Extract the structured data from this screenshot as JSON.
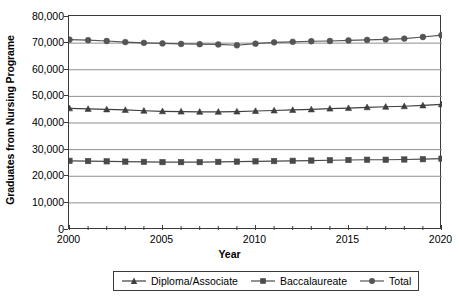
{
  "chart_data": {
    "type": "line",
    "title": "",
    "xlabel": "Year",
    "ylabel": "Graduates from Nursing Programe",
    "xlim": [
      2000,
      2020
    ],
    "ylim": [
      0,
      80000
    ],
    "grid": true,
    "legend_position": "bottom",
    "x": [
      2000,
      2001,
      2002,
      2003,
      2004,
      2005,
      2006,
      2007,
      2008,
      2009,
      2010,
      2011,
      2012,
      2013,
      2014,
      2015,
      2016,
      2017,
      2018,
      2019,
      2020
    ],
    "y_ticks": [
      0,
      10000,
      20000,
      30000,
      40000,
      50000,
      60000,
      70000,
      80000
    ],
    "y_tick_labels": [
      "0",
      "10,000",
      "20,000",
      "30,000",
      "40,000",
      "50,000",
      "60,000",
      "70,000",
      "80,000"
    ],
    "x_ticks": [
      2000,
      2005,
      2010,
      2015,
      2020
    ],
    "x_tick_labels": [
      "2000",
      "2005",
      "2010",
      "2015",
      "2020"
    ],
    "x_minor_tick_step": 1,
    "series": [
      {
        "name": "Diploma/Associate",
        "marker": "triangle",
        "color": "#3f3f3f",
        "values": [
          45500,
          45300,
          45100,
          44900,
          44600,
          44400,
          44300,
          44200,
          44200,
          44300,
          44500,
          44700,
          44900,
          45100,
          45400,
          45600,
          45900,
          46100,
          46300,
          46600,
          47000
        ]
      },
      {
        "name": "Baccalaureate",
        "marker": "square",
        "color": "#4a4a4a",
        "values": [
          25800,
          25700,
          25600,
          25500,
          25400,
          25300,
          25300,
          25300,
          25400,
          25500,
          25600,
          25700,
          25800,
          25900,
          26000,
          26100,
          26200,
          26200,
          26300,
          26400,
          26600
        ]
      },
      {
        "name": "Total",
        "marker": "circle",
        "color": "#555555",
        "values": [
          71300,
          71100,
          70800,
          70400,
          70100,
          69900,
          69700,
          69600,
          69500,
          69200,
          69800,
          70300,
          70500,
          70700,
          70800,
          71000,
          71200,
          71400,
          71700,
          72300,
          73000
        ]
      }
    ]
  },
  "axes": {
    "y_title": "Graduates from Nursing Programe",
    "x_title": "Year"
  },
  "legend": {
    "entries": [
      {
        "label": "Diploma/Associate",
        "marker": "triangle"
      },
      {
        "label": "Baccalaureate",
        "marker": "square"
      },
      {
        "label": "Total",
        "marker": "circle"
      }
    ]
  },
  "colors": {
    "axis": "#3a3a3a",
    "gridline": "#8f8f8f",
    "series_diploma": "#3f3f3f",
    "series_baccalaureate": "#4a4a4a",
    "series_total": "#555555",
    "background": "#ffffff"
  }
}
